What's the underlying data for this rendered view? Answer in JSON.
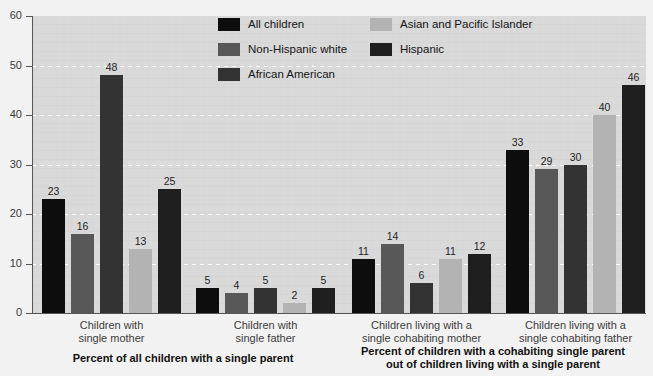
{
  "chart_data": {
    "type": "bar",
    "title": "",
    "xlabel": "",
    "ylabel": "",
    "ylim": [
      0,
      60
    ],
    "yticks": [
      0,
      10,
      20,
      30,
      40,
      50,
      60
    ],
    "grid": true,
    "legend_position": "top-center",
    "categories": [
      "Children with\nsingle mother",
      "Children with\nsingle father",
      "Children living with a\nsingle cohabiting mother",
      "Children living with a\nsingle cohabiting father"
    ],
    "series": [
      {
        "name": "All children",
        "color": "#0d0d0d",
        "values": [
          23,
          5,
          11,
          33
        ]
      },
      {
        "name": "Non-Hispanic white",
        "color": "#585858",
        "values": [
          16,
          4,
          14,
          29
        ]
      },
      {
        "name": "African American",
        "color": "#333333",
        "values": [
          48,
          5,
          6,
          30
        ]
      },
      {
        "name": "Asian and Pacific Islander",
        "color": "#b3b3b3",
        "values": [
          13,
          2,
          11,
          40
        ]
      },
      {
        "name": "Hispanic",
        "color": "#1f1f1f",
        "values": [
          25,
          5,
          12,
          46
        ]
      }
    ],
    "annotations": [
      "Percent of all children with a single parent",
      "Percent of children with a cohabiting single parent\nout of children living with a single parent"
    ]
  },
  "axis": {
    "tick_60": "60",
    "tick_50": "50",
    "tick_40": "40",
    "tick_30": "30",
    "tick_20": "20",
    "tick_10": "10",
    "tick_0": "0"
  },
  "legend": {
    "items": [
      {
        "label": "All children",
        "color": "#0d0d0d"
      },
      {
        "label": "Non-Hispanic white",
        "color": "#585858"
      },
      {
        "label": "African American",
        "color": "#333333"
      },
      {
        "label": "Asian and Pacific Islander",
        "color": "#b3b3b3"
      },
      {
        "label": "Hispanic",
        "color": "#1f1f1f"
      }
    ]
  },
  "group_labels": [
    "Children with\nsingle mother",
    "Children with\nsingle father",
    "Children living with a\nsingle cohabiting mother",
    "Children living with a\nsingle cohabiting father"
  ],
  "section_captions": [
    "Percent of all children with a single parent",
    "Percent of children with a cohabiting single parent\nout of children living with a single parent"
  ],
  "bar_values": {
    "g0": [
      "23",
      "16",
      "48",
      "13",
      "25"
    ],
    "g1": [
      "5",
      "4",
      "5",
      "2",
      "5"
    ],
    "g2": [
      "11",
      "14",
      "6",
      "11",
      "12"
    ],
    "g3": [
      "33",
      "29",
      "30",
      "40",
      "46"
    ]
  },
  "colors": {
    "plot_background": "#d9d9d9",
    "page_background": "#f2f2f2",
    "gridline": "#ffffff",
    "axis": "#555555"
  }
}
